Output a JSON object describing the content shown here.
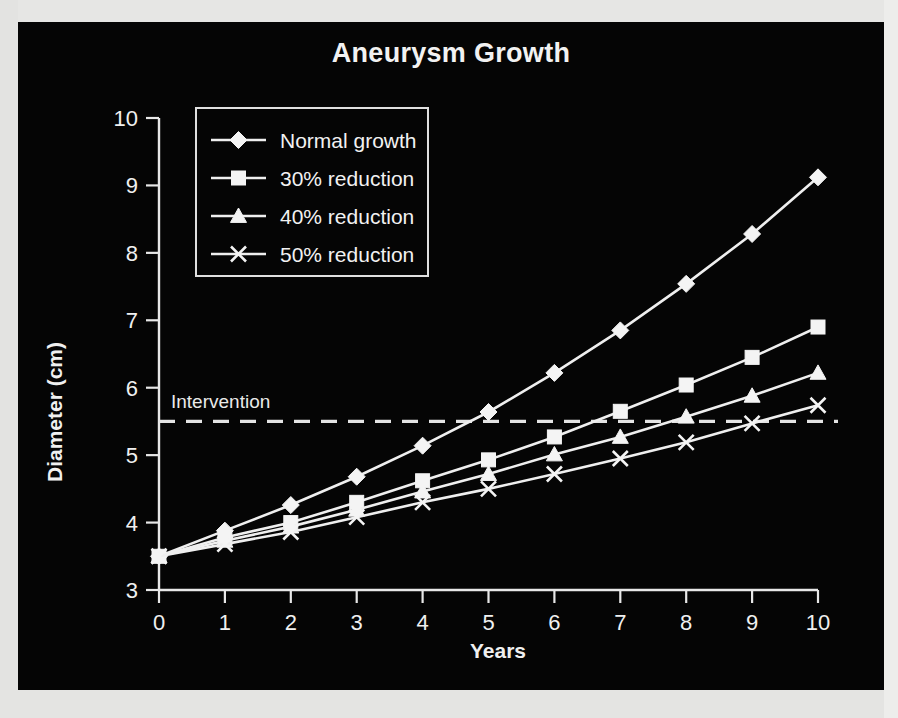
{
  "figure": {
    "background_color": "#050505",
    "ink_color": "#f2f2f2",
    "page_color": "#dcdcda"
  },
  "chart_data": {
    "type": "line",
    "title": "Aneurysm Growth",
    "xlabel": "Years",
    "ylabel": "Diameter (cm)",
    "x": [
      0,
      1,
      2,
      3,
      4,
      5,
      6,
      7,
      8,
      9,
      10
    ],
    "xlim": [
      0,
      10
    ],
    "ylim": [
      3,
      10
    ],
    "xticks": [
      0,
      1,
      2,
      3,
      4,
      5,
      6,
      7,
      8,
      9,
      10
    ],
    "yticks": [
      3,
      4,
      5,
      6,
      7,
      8,
      9,
      10
    ],
    "xtick_labels": [
      "0",
      "1",
      "2",
      "3",
      "4",
      "5",
      "6",
      "7",
      "8",
      "9",
      "10"
    ],
    "ytick_labels": [
      "3",
      "4",
      "5",
      "6",
      "7",
      "8",
      "9",
      "10"
    ],
    "grid": false,
    "legend_position": "upper-left",
    "series": [
      {
        "name": "Normal growth",
        "marker": "diamond",
        "values": [
          3.5,
          3.88,
          4.26,
          4.68,
          5.14,
          5.64,
          6.22,
          6.85,
          7.54,
          8.28,
          9.12
        ]
      },
      {
        "name": "30% reduction",
        "marker": "square",
        "values": [
          3.5,
          3.78,
          4.0,
          4.3,
          4.62,
          4.93,
          5.27,
          5.65,
          6.04,
          6.45,
          6.9
        ]
      },
      {
        "name": "40% reduction",
        "marker": "triangle",
        "values": [
          3.5,
          3.73,
          3.94,
          4.19,
          4.46,
          4.72,
          5.01,
          5.27,
          5.57,
          5.88,
          6.22
        ]
      },
      {
        "name": "50% reduction",
        "marker": "x",
        "values": [
          3.5,
          3.68,
          3.86,
          4.08,
          4.3,
          4.5,
          4.72,
          4.95,
          5.19,
          5.47,
          5.74
        ]
      }
    ],
    "annotations": [
      {
        "label": "Intervention",
        "type": "horizontal-threshold-line",
        "value": 5.5,
        "style": "dashed"
      }
    ]
  }
}
